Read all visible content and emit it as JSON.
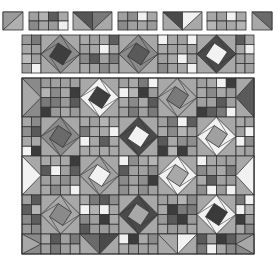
{
  "canvas": {
    "width": 278,
    "height": 256,
    "background": "#ffffff"
  },
  "palette": {
    "light": "#f2f2f2",
    "mid": "#a8a8a8",
    "midlight": "#bdbdbd",
    "middark": "#8a8a8a",
    "dark": "#5a5a5a",
    "darker": "#3c3c3c",
    "line": "#333333"
  },
  "top_row": {
    "y": 12,
    "h": 18,
    "blocks": [
      {
        "type": "half-square",
        "x": 3,
        "w": 20,
        "colors": [
          "#9a9a9a",
          "#b0b0b0"
        ],
        "dir": "up"
      },
      {
        "type": "checker",
        "x": 29,
        "w": 39,
        "cols": 4,
        "rows": 2,
        "cells": [
          "#a0a0a0",
          "#b2b2b2",
          "#5c5c5c",
          "#a8a8a8",
          "#8a8a8a",
          "#a6a6a6",
          "#9a9a9a",
          "#f0f0f0"
        ]
      },
      {
        "type": "flying-geese",
        "x": 73,
        "w": 39,
        "colors": [
          "#555555",
          "#7a7a7a",
          "#a8a8a8"
        ]
      },
      {
        "type": "checker",
        "x": 118,
        "w": 39,
        "cols": 4,
        "rows": 2,
        "cells": [
          "#a0a0a0",
          "#8e8e8e",
          "#f0f0f0",
          "#a8a8a8",
          "#8a8a8a",
          "#a0a0a0",
          "#a6a6a6",
          "#9a9a9a"
        ]
      },
      {
        "type": "flying-geese",
        "x": 163,
        "w": 39,
        "colors": [
          "#4a4a4a",
          "#f2f2f2",
          "#a8a8a8"
        ]
      },
      {
        "type": "checker",
        "x": 207,
        "w": 39,
        "cols": 4,
        "rows": 2,
        "cells": [
          "#a8a8a8",
          "#a0a0a0",
          "#f2f2f2",
          "#a8a8a8",
          "#b6b6b6",
          "#a0a0a0",
          "#a8a8a8",
          "#b4b4b4"
        ]
      },
      {
        "type": "half-square",
        "x": 252,
        "w": 20,
        "colors": [
          "#6a6a6a",
          "#a8a8a8"
        ],
        "dir": "down"
      }
    ]
  },
  "strip": {
    "x": 22,
    "y": 35,
    "w": 232,
    "h": 38,
    "columns": [
      {
        "type": "checker",
        "w": 19,
        "cols": 2,
        "cells": [
          "#9a9a9a",
          "#7a7a7a",
          "#a8a8a8",
          "#a0a0a0",
          "#bcbcbc",
          "#a0a0a0",
          "#a0a0a0",
          "#f2f2f2"
        ]
      },
      {
        "type": "diamond",
        "w": 39,
        "outer": "#a8a8a8",
        "ring": "#8c8c8c",
        "core": "#3e3e3e"
      },
      {
        "type": "checker",
        "w": 39,
        "cols": 4,
        "cells": [
          "#a8a8a8",
          "#a0a0a0",
          "#a8a8a8",
          "#5e5e5e",
          "#a0a0a0",
          "#a8a8a8",
          "#f2f2f2",
          "#a8a8a8",
          "#8a8a8a",
          "#5a5a5a",
          "#a0a0a0",
          "#7a7a7a",
          "#a8a8a8",
          "#a0a0a0",
          "#8a8a8a",
          "#a0a0a0"
        ]
      },
      {
        "type": "diamond",
        "w": 39,
        "outer": "#a8a8a8",
        "ring": "#8a8a8a",
        "core": "#5a5a5a"
      },
      {
        "type": "checker",
        "w": 39,
        "cols": 4,
        "cells": [
          "#f2f2f2",
          "#a8a8a8",
          "#a0a0a0",
          "#f2f2f2",
          "#a8a8a8",
          "#a0a0a0",
          "#a8a8a8",
          "#a0a0a0",
          "#a0a0a0",
          "#a8a8a8",
          "#f2f2f2",
          "#a0a0a0",
          "#8a8a8a",
          "#a0a0a0",
          "#a8a8a8",
          "#f2f2f2"
        ]
      },
      {
        "type": "diamond",
        "w": 39,
        "outer": "#a8a8a8",
        "ring": "#4a4a4a",
        "core": "#f2f2f2"
      },
      {
        "type": "checker",
        "w": 18,
        "cols": 2,
        "cells": [
          "#5a5a5a",
          "#a8a8a8",
          "#a8a8a8",
          "#f0f0f0",
          "#a0a0a0",
          "#a8a8a8",
          "#a8a8a8",
          "#a0a0a0"
        ]
      }
    ]
  },
  "grid": {
    "x": 22,
    "y": 78,
    "w": 232,
    "h": 176,
    "col_widths": [
      19,
      39,
      39,
      39,
      39,
      39,
      18
    ],
    "row_heights": [
      39,
      39,
      39,
      39,
      20
    ],
    "top_offset": 0,
    "rows": [
      [
        "edgeL:#a8a8a8:#8a8a8a",
        "checker",
        "diamond:#f2f2f2:#3e3e3e",
        "checker",
        "diamond:#a8a8a8:#7a7a7a",
        "checker",
        "edgeR:#5a5a5a:#a8a8a8"
      ],
      [
        "checker",
        "diamond:#8a8a8a:#6a6a6a",
        "checker",
        "diamond:#4a4a4a:#f2f2f2",
        "checker",
        "diamond:#f2f2f2:#a0a0a0",
        "checker"
      ],
      [
        "edgeL:#f2f2f2:#a8a8a8",
        "checker",
        "diamond:#a0a0a0:#f2f2f2",
        "checker",
        "diamond:#f2f2f2:#a8a8a8",
        "checker",
        "edgeR:#f2f2f2:#a8a8a8"
      ],
      [
        "checker",
        "diamond:#a8a8a8:#8a8a8a",
        "checker",
        "diamond:#4a4a4a:#a8a8a8",
        "checker",
        "diamond:#f2f2f2:#3a3a3a",
        "checker"
      ],
      [
        "edgeL:#a8a8a8:#8a8a8a",
        "checker",
        "geese:#6a6a6a:#4a4a4a",
        "checker",
        "geese:#a8a8a8:#f2f2f2",
        "checker",
        "edgeR:#a8a8a8:#8a8a8a"
      ]
    ],
    "checker_tones": [
      "#a8a8a8",
      "#a0a0a0",
      "#8a8a8a",
      "#b4b4b4",
      "#5a5a5a",
      "#f2f2f2",
      "#3c3c3c",
      "#9a9a9a",
      "#a8a8a8",
      "#a0a0a0",
      "#7a7a7a",
      "#a8a8a8",
      "#f2f2f2",
      "#a8a8a8",
      "#8e8e8e",
      "#a0a0a0",
      "#5e5e5e"
    ]
  }
}
